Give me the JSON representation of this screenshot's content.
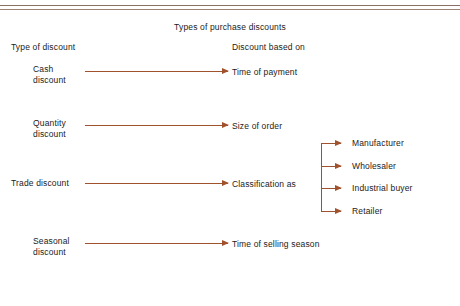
{
  "diagram": {
    "title": "Types of purchase discounts",
    "accent_color": "#a0522d",
    "text_color": "#1b1b1b",
    "rule_color": "#8a7064",
    "columns": {
      "left_header": "Type of discount",
      "right_header": "Discount based on"
    },
    "rows": [
      {
        "label_line1": "Cash",
        "label_line2": "discount",
        "connector": "arrow-right",
        "result": "Time of payment"
      },
      {
        "label_line1": "Quantity",
        "label_line2": "discount",
        "connector": "arrow-right",
        "result": "Size of order"
      },
      {
        "label_line1": "Trade discount",
        "label_line2": "",
        "connector": "arrow-right",
        "result": "Classification as"
      },
      {
        "label_line1": "Seasonal",
        "label_line2": "discount",
        "connector": "arrow-right",
        "result": "Time of selling season"
      }
    ],
    "branch": {
      "source_row": "Classification as",
      "items": [
        {
          "label": "Manufacturer"
        },
        {
          "label": "Wholesaler"
        },
        {
          "label": "Industrial buyer"
        },
        {
          "label": "Retailer"
        }
      ]
    }
  }
}
